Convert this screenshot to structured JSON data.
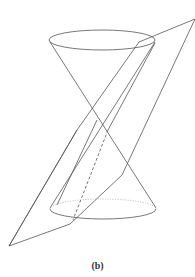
{
  "figure": {
    "caption": "(b)",
    "stroke_color": "#555555",
    "hidden_color": "#aaaaaa"
  }
}
